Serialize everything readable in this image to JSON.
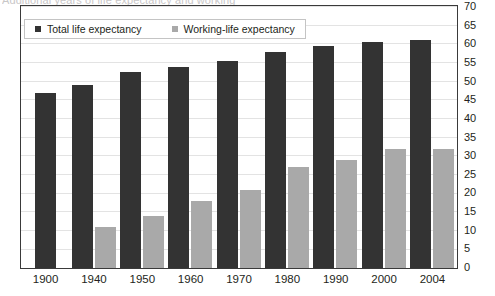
{
  "chart_data": {
    "type": "bar",
    "title": "Additional years of life expectancy and working",
    "subtitle": "",
    "xlabel": "",
    "ylabel": "",
    "ylim": [
      0,
      70
    ],
    "ytick_step": 5,
    "yticks": [
      70,
      65,
      60,
      55,
      50,
      45,
      40,
      35,
      30,
      25,
      20,
      15,
      10,
      5,
      0
    ],
    "grid": true,
    "y_axis_position": "right",
    "legend_position": "top-left-inside",
    "categories": [
      "1900",
      "1940",
      "1950",
      "1960",
      "1970",
      "1980",
      "1990",
      "2000",
      "2004"
    ],
    "series": [
      {
        "name": "Total life expectancy",
        "color": "#333333",
        "values": [
          47,
          49,
          52.5,
          54,
          55.5,
          58,
          59.5,
          60.5,
          61
        ]
      },
      {
        "name": "Working-life expectancy",
        "color": "#a9a9a9",
        "values": [
          null,
          11,
          14,
          18,
          21,
          27,
          29,
          32,
          32
        ]
      }
    ]
  },
  "legend": {
    "items": [
      {
        "label": "Total life expectancy",
        "swatch": "dark-square-icon"
      },
      {
        "label": "Working-life expectancy",
        "swatch": "gray-square-icon"
      }
    ]
  },
  "colors": {
    "total": "#333333",
    "working": "#a9a9a9",
    "gridline": "#e3e3e3",
    "frame": "#3a3a3a",
    "text": "#231f20",
    "title": "#c9c7c8"
  }
}
